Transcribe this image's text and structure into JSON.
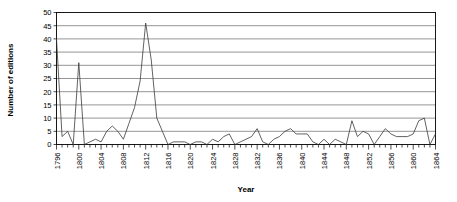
{
  "chart_data": {
    "type": "line",
    "title": "",
    "xlabel": "Year",
    "ylabel": "Number of editions",
    "xlim": [
      1796,
      1864
    ],
    "ylim": [
      0,
      50
    ],
    "yticks": [
      0,
      5,
      10,
      15,
      20,
      25,
      30,
      35,
      40,
      45,
      50
    ],
    "xticks_labeled": [
      1796,
      1800,
      1804,
      1808,
      1812,
      1816,
      1820,
      1824,
      1828,
      1832,
      1836,
      1840,
      1844,
      1848,
      1852,
      1856,
      1860,
      1864
    ],
    "xtick_interval": 1,
    "xtick_label_interval": 4,
    "grid": "horizontal",
    "legend": "none",
    "series_name": "Number of editions",
    "line_color": "#3a3a3a",
    "x": [
      1796,
      1797,
      1798,
      1799,
      1800,
      1801,
      1802,
      1803,
      1804,
      1805,
      1806,
      1807,
      1808,
      1809,
      1810,
      1811,
      1812,
      1813,
      1814,
      1815,
      1816,
      1817,
      1818,
      1819,
      1820,
      1821,
      1822,
      1823,
      1824,
      1825,
      1826,
      1827,
      1828,
      1829,
      1830,
      1831,
      1832,
      1833,
      1834,
      1835,
      1836,
      1837,
      1838,
      1839,
      1840,
      1841,
      1842,
      1843,
      1844,
      1845,
      1846,
      1847,
      1848,
      1849,
      1850,
      1851,
      1852,
      1853,
      1854,
      1855,
      1856,
      1857,
      1858,
      1859,
      1860,
      1861,
      1862,
      1863,
      1864
    ],
    "values": [
      40,
      3,
      5,
      0,
      31,
      0,
      1,
      2,
      1,
      5,
      7,
      5,
      2,
      8,
      14,
      24,
      46,
      32,
      10,
      5,
      0,
      1,
      1,
      1,
      0,
      1,
      1,
      0,
      2,
      1,
      3,
      4,
      0,
      1,
      2,
      3,
      6,
      1,
      0,
      2,
      3,
      5,
      6,
      4,
      4,
      4,
      1,
      0,
      2,
      0,
      2,
      1,
      0,
      9,
      3,
      5,
      4,
      0,
      3,
      6,
      4,
      3,
      3,
      3,
      4,
      9,
      10,
      0,
      4
    ]
  },
  "axes": {
    "ylabel": "Number of editions",
    "xlabel": "Year"
  }
}
